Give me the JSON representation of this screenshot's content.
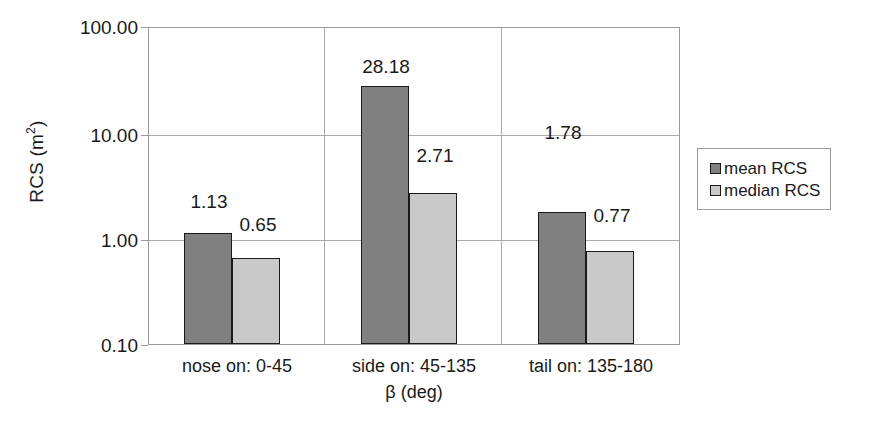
{
  "chart_data": {
    "type": "bar",
    "title": "",
    "xlabel": "β (deg)",
    "ylabel": "RCS (m²)",
    "ylabel_text": "RCS (m",
    "ylabel_sup": "2",
    "ylabel_close": ")",
    "yscale": "log",
    "ylim": [
      0.1,
      100.0
    ],
    "ytick_labels": [
      "100.00",
      "10.00",
      "1.00",
      "0.10"
    ],
    "ytick_values": [
      100.0,
      10.0,
      1.0,
      0.1
    ],
    "grid": "both",
    "legend_position": "right",
    "categories": [
      "nose on:  0-45",
      "side on: 45-135",
      "tail on: 135-180"
    ],
    "series": [
      {
        "name": "mean RCS",
        "color": "#808080",
        "values": [
          1.13,
          28.18,
          1.78
        ],
        "labels": [
          "1.13",
          "28.18",
          "1.78"
        ]
      },
      {
        "name": "median RCS",
        "color": "#c9c9c9",
        "values": [
          0.65,
          2.71,
          0.77
        ],
        "labels": [
          "0.65",
          "2.71",
          "0.77"
        ]
      }
    ]
  },
  "legend": {
    "items": [
      {
        "label": "mean RCS"
      },
      {
        "label": "median RCS"
      }
    ]
  }
}
